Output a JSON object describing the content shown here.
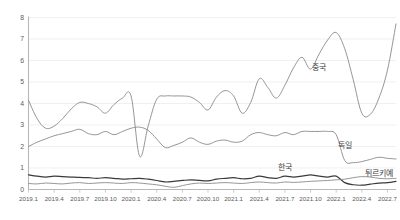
{
  "chart_data": {
    "type": "line",
    "title": "",
    "subtitle": "",
    "xlabel": "",
    "ylabel": "",
    "ylim": [
      0,
      8
    ],
    "yticks": [
      0,
      1,
      2,
      3,
      4,
      5,
      6,
      7,
      8
    ],
    "ytick_labels": [
      "0",
      "1",
      "2",
      "3",
      "4",
      "5",
      "6",
      "7",
      "8"
    ],
    "grid": true,
    "legend_position": "inline-right",
    "x_tick_labels": [
      "2019.1",
      "2019.4",
      "2019.7",
      "2019.10",
      "2020.1",
      "2020.4",
      "2020.7",
      "2020.10",
      "2021.1",
      "2021.4",
      "2021.7",
      "2021.10",
      "2022.1",
      "2022.4",
      "2022.7"
    ],
    "x_tick_indices": [
      0,
      3,
      6,
      9,
      12,
      15,
      18,
      21,
      24,
      27,
      30,
      33,
      36,
      39,
      42
    ],
    "x": [
      "2019.1",
      "2019.2",
      "2019.3",
      "2019.4",
      "2019.5",
      "2019.6",
      "2019.7",
      "2019.8",
      "2019.9",
      "2019.10",
      "2019.11",
      "2019.12",
      "2020.1",
      "2020.2",
      "2020.3",
      "2020.4",
      "2020.5",
      "2020.6",
      "2020.7",
      "2020.8",
      "2020.9",
      "2020.10",
      "2020.11",
      "2020.12",
      "2021.1",
      "2021.2",
      "2021.3",
      "2021.4",
      "2021.5",
      "2021.6",
      "2021.7",
      "2021.8",
      "2021.9",
      "2021.10",
      "2021.11",
      "2021.12",
      "2022.1",
      "2022.2",
      "2022.3",
      "2022.4",
      "2022.5",
      "2022.6",
      "2022.7",
      "2022.8"
    ],
    "series": [
      {
        "name": "중국",
        "color": "#8a8a8a",
        "width": 0.9,
        "label_x_index": 34,
        "label_y": 5.55,
        "values": [
          4.15,
          3.3,
          2.85,
          2.95,
          3.3,
          3.75,
          4.05,
          4.0,
          3.85,
          3.55,
          3.95,
          4.25,
          4.35,
          1.55,
          2.95,
          4.2,
          4.35,
          4.35,
          4.35,
          4.3,
          4.05,
          3.7,
          4.3,
          4.6,
          4.35,
          3.55,
          4.05,
          5.15,
          4.75,
          4.25,
          4.85,
          5.65,
          6.15,
          5.6,
          6.3,
          6.95,
          7.3,
          6.55,
          5.1,
          3.55,
          3.5,
          4.25,
          5.55,
          7.7
        ]
      },
      {
        "name": "독일",
        "color": "#8a8a8a",
        "width": 0.9,
        "label_x_index": 37,
        "label_y": 1.92,
        "values": [
          2.0,
          2.2,
          2.35,
          2.5,
          2.6,
          2.7,
          2.8,
          2.6,
          2.55,
          2.7,
          2.55,
          2.7,
          2.85,
          2.9,
          2.75,
          2.35,
          1.95,
          2.05,
          2.2,
          2.4,
          2.2,
          2.1,
          2.25,
          2.3,
          2.2,
          2.25,
          2.55,
          2.65,
          2.55,
          2.5,
          2.65,
          2.55,
          2.7,
          2.7,
          2.7,
          2.7,
          2.55,
          1.35,
          1.25,
          1.3,
          1.4,
          1.5,
          1.45,
          1.42
        ]
      },
      {
        "name": "한국",
        "color": "#3a3a3a",
        "width": 1.2,
        "label_x_index": 30,
        "label_y": 0.92,
        "values": [
          0.68,
          0.62,
          0.58,
          0.62,
          0.6,
          0.58,
          0.56,
          0.55,
          0.52,
          0.55,
          0.52,
          0.48,
          0.5,
          0.52,
          0.48,
          0.42,
          0.35,
          0.38,
          0.42,
          0.45,
          0.42,
          0.4,
          0.48,
          0.52,
          0.55,
          0.5,
          0.52,
          0.62,
          0.55,
          0.52,
          0.62,
          0.58,
          0.62,
          0.68,
          0.62,
          0.58,
          0.62,
          0.32,
          0.22,
          0.2,
          0.25,
          0.3,
          0.32,
          0.38
        ]
      },
      {
        "name": "튀르키예",
        "color": "#8a8a8a",
        "width": 0.9,
        "label_x_index": 41,
        "label_y": 0.62,
        "values": [
          0.28,
          0.26,
          0.3,
          0.28,
          0.26,
          0.3,
          0.32,
          0.28,
          0.3,
          0.32,
          0.3,
          0.28,
          0.32,
          0.3,
          0.26,
          0.22,
          0.15,
          0.1,
          0.18,
          0.26,
          0.3,
          0.28,
          0.3,
          0.32,
          0.3,
          0.28,
          0.32,
          0.35,
          0.32,
          0.3,
          0.35,
          0.33,
          0.35,
          0.38,
          0.4,
          0.42,
          0.45,
          0.48,
          0.55,
          0.6,
          0.58,
          0.52,
          0.5,
          0.52
        ]
      }
    ]
  },
  "axis": {
    "axis_color": "#b8b8b8",
    "grid_color": "#e9e9e9",
    "tick_color": "#5a5a5a"
  }
}
